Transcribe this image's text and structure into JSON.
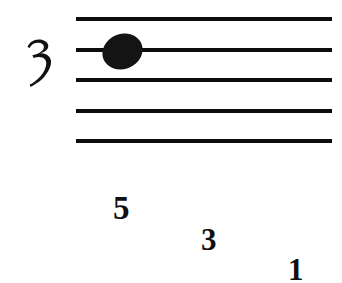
{
  "document": {
    "kind": "music-notation-excerpt",
    "background_color": "#ffffff",
    "ink_color": "#101010"
  },
  "staff": {
    "name": "five-line-staff",
    "line_count": 5,
    "lines": [
      {
        "label": "staff-line-1",
        "top": 17
      },
      {
        "label": "staff-line-2",
        "top": 48
      },
      {
        "label": "staff-line-3",
        "top": 78
      },
      {
        "label": "staff-line-4",
        "top": 109
      },
      {
        "label": "staff-line-5",
        "top": 139
      }
    ],
    "left": 76,
    "right": 332,
    "line_thickness": 4,
    "color": "#0d0d0d"
  },
  "clef": {
    "glyph_name": "cursive-three-clef",
    "label": "3",
    "description": "stylized handwritten numeral three"
  },
  "note": {
    "name": "filled-notehead",
    "head_shape": "ellipse",
    "filled": true,
    "rotation_degrees": -22,
    "staff_line": 2,
    "color": "#141414"
  },
  "fingerings": [
    {
      "name": "fingering-number-5",
      "label": "5",
      "left": 113,
      "top": 192,
      "font_size": 33
    },
    {
      "name": "fingering-number-3",
      "label": "3",
      "left": 201,
      "top": 224,
      "font_size": 31
    },
    {
      "name": "fingering-number-1",
      "label": "1",
      "left": 288,
      "top": 254,
      "font_size": 31
    }
  ]
}
